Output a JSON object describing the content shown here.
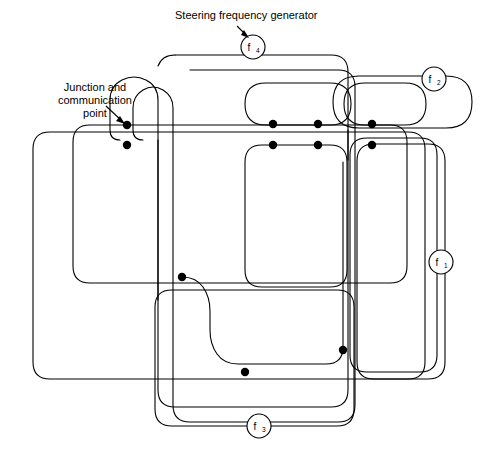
{
  "diagram": {
    "title_annotation": "Steering frequency generator",
    "junction_annotation_lines": [
      "Junction and",
      "communication",
      "point"
    ],
    "canvas": {
      "width": 500,
      "height": 461,
      "background": "#ffffff"
    },
    "stroke_color": "#000000",
    "dot_color": "#000000",
    "nodes": [
      {
        "id": "f4",
        "base": "f",
        "sub": "4",
        "cx": 253,
        "cy": 47,
        "r": 12
      },
      {
        "id": "f2",
        "base": "f",
        "sub": "2",
        "cx": 434,
        "cy": 79,
        "r": 12
      },
      {
        "id": "f1",
        "base": "f",
        "sub": "1",
        "cx": 441,
        "cy": 262,
        "r": 12
      },
      {
        "id": "f3",
        "base": "f",
        "sub": "3",
        "cx": 259,
        "cy": 426,
        "r": 12
      }
    ],
    "junction_points": [
      {
        "id": "jp-annotated",
        "cx": 127,
        "cy": 125,
        "r": 4.2
      },
      {
        "id": "jp-left-lower",
        "cx": 127,
        "cy": 145,
        "r": 4.2
      },
      {
        "id": "jp-mid-a-upper",
        "cx": 273,
        "cy": 124,
        "r": 4.2
      },
      {
        "id": "jp-mid-a-lower",
        "cx": 273,
        "cy": 145,
        "r": 4.2
      },
      {
        "id": "jp-mid-b-upper",
        "cx": 318,
        "cy": 124,
        "r": 4.2
      },
      {
        "id": "jp-mid-b-lower",
        "cx": 318,
        "cy": 145,
        "r": 4.2
      },
      {
        "id": "jp-right-upper",
        "cx": 372,
        "cy": 124,
        "r": 4.2
      },
      {
        "id": "jp-right-lower",
        "cx": 372,
        "cy": 145,
        "r": 4.2
      },
      {
        "id": "jp-center",
        "cx": 182,
        "cy": 277,
        "r": 4.2
      },
      {
        "id": "jp-lower-right",
        "cx": 343,
        "cy": 350,
        "r": 4.2
      },
      {
        "id": "jp-lower-mid",
        "cx": 245,
        "cy": 372,
        "r": 4.2
      }
    ],
    "loops": [
      {
        "id": "loop-f4-outer",
        "name": "f4-steering-loop"
      },
      {
        "id": "loop-f4-inner",
        "name": "f4-inner-loop"
      },
      {
        "id": "loop-f2-outer",
        "name": "f2-loop"
      },
      {
        "id": "loop-f2-inner",
        "name": "f2-inner-loop"
      },
      {
        "id": "loop-f1-outer",
        "name": "f1-loop"
      },
      {
        "id": "loop-f1-inner",
        "name": "f1-inner-loop"
      },
      {
        "id": "loop-f3-outer",
        "name": "f3-loop"
      },
      {
        "id": "loop-left-outer",
        "name": "left-outer-loop"
      },
      {
        "id": "loop-left-inner",
        "name": "left-inner-loop"
      },
      {
        "id": "loop-mid-lower",
        "name": "mid-lower-loop"
      }
    ]
  }
}
